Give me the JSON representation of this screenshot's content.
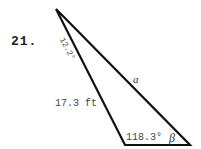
{
  "problem": {
    "number": "21."
  },
  "triangle": {
    "vertices": {
      "apex": [
        56,
        9
      ],
      "bottom_left": [
        125,
        145
      ],
      "bottom_right": [
        190,
        145
      ]
    },
    "labels": {
      "apex_angle": "12.2°",
      "side_opposite_bottom_left": "a",
      "left_side": "17.3 ft",
      "bottom_left_angle": "118.3°",
      "bottom_right_angle": "β"
    },
    "stroke_color": "#111111"
  }
}
